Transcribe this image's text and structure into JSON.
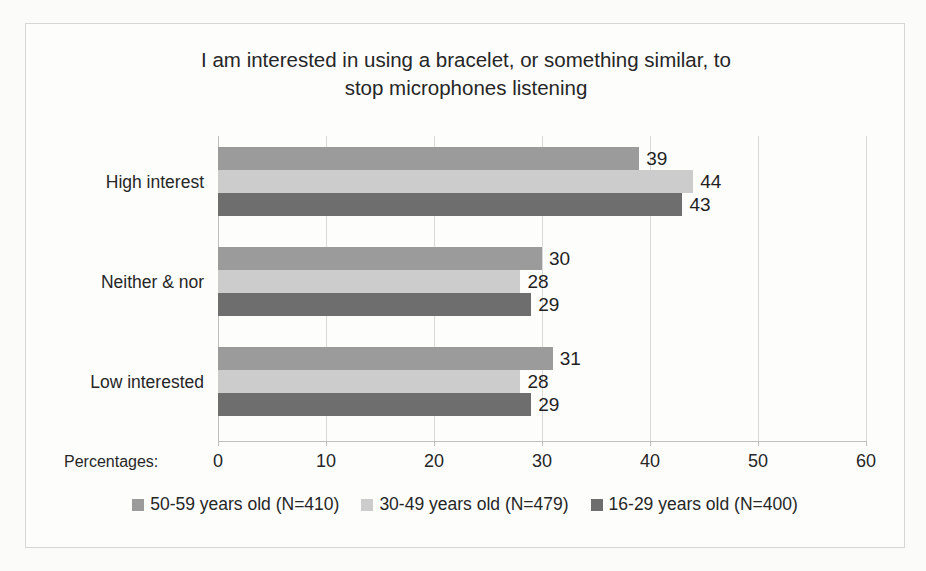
{
  "chart_data": {
    "type": "bar",
    "orientation": "horizontal",
    "title": "I am interested in using a bracelet, or something  similar, to stop microphones listening",
    "title_lines": [
      "I am interested in using a bracelet, or something  similar, to",
      "stop microphones listening"
    ],
    "categories": [
      "High interest",
      "Neither & nor",
      "Low interested"
    ],
    "series": [
      {
        "name": "50-59 years old (N=410)",
        "color": "#9b9b9b",
        "values": [
          39,
          30,
          31
        ]
      },
      {
        "name": "30-49 years old (N=479)",
        "color": "#cccccc",
        "values": [
          44,
          28,
          28
        ]
      },
      {
        "name": "16-29 years old (N=400)",
        "color": "#6e6e6e",
        "values": [
          43,
          29,
          29
        ]
      }
    ],
    "xlabel": "Percentages:",
    "ylabel": "",
    "xlim": [
      0,
      60
    ],
    "xticks": [
      0,
      10,
      20,
      30,
      40,
      50,
      60
    ],
    "xtick_labels": [
      "0",
      "10",
      "20",
      "30",
      "40",
      "50",
      "60"
    ],
    "grid": "vertical",
    "legend_position": "bottom",
    "data_labels": true
  }
}
